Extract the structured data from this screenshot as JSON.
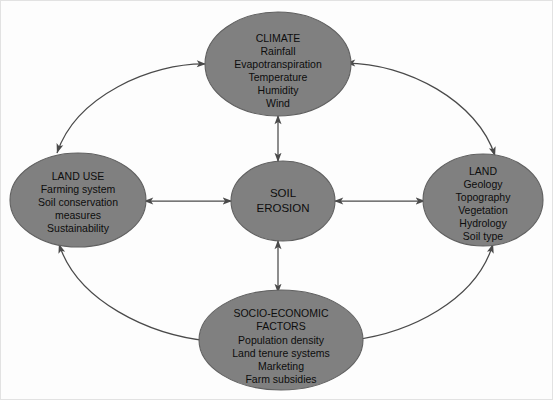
{
  "diagram": {
    "colors": {
      "node_fill": "#808080",
      "node_stroke": "#606060",
      "connector": "#4a4a4a",
      "text": "#0d0d0d",
      "background": "#fdfdfd",
      "border": "#e2e2e2"
    },
    "nodes": [
      {
        "id": "climate",
        "title": "CLIMATE",
        "items": [
          "Rainfall",
          "Evapotranspiration",
          "Temperature",
          "Humidity",
          "Wind"
        ],
        "lines": [
          "CLIMATE",
          "Rainfall",
          "Evapotranspiration",
          "Temperature",
          "Humidity",
          "Wind"
        ]
      },
      {
        "id": "land-use",
        "title": "LAND USE",
        "items": [
          "Farming system",
          "Soil conservation",
          "measures",
          "Sustainability"
        ],
        "lines": [
          "LAND USE",
          "Farming system",
          "Soil conservation",
          "measures",
          "Sustainability"
        ]
      },
      {
        "id": "soil-erosion",
        "title": "SOIL EROSION",
        "items": [],
        "lines": [
          "SOIL",
          "EROSION"
        ]
      },
      {
        "id": "land",
        "title": "LAND",
        "items": [
          "Geology",
          "Topography",
          "Vegetation",
          "Hydrology",
          "Soil type"
        ],
        "lines": [
          "LAND",
          "Geology",
          "Topography",
          "Vegetation",
          "Hydrology",
          "Soil type"
        ]
      },
      {
        "id": "socio-economic-factors",
        "title": "SOCIO-ECONOMIC FACTORS",
        "items": [
          "Population density",
          "Land tenure systems",
          "Marketing",
          "Farm subsidies"
        ],
        "lines": [
          "SOCIO-ECONOMIC",
          "FACTORS",
          "Population density",
          "Land tenure systems",
          "Marketing",
          "Farm subsidies"
        ]
      }
    ],
    "connectors": [
      {
        "id": "climate-soil-erosion",
        "from": "CLIMATE",
        "to": "SOIL EROSION",
        "kind": "straight",
        "bidirectional": true
      },
      {
        "id": "socio-economic-soil-erosion",
        "from": "SOCIO-ECONOMIC FACTORS",
        "to": "SOIL EROSION",
        "kind": "straight",
        "bidirectional": true
      },
      {
        "id": "land-use-soil-erosion",
        "from": "LAND USE",
        "to": "SOIL EROSION",
        "kind": "straight",
        "bidirectional": true
      },
      {
        "id": "land-soil-erosion",
        "from": "SOIL EROSION",
        "to": "LAND",
        "kind": "straight",
        "bidirectional": true
      },
      {
        "id": "climate-land-use",
        "from": "CLIMATE",
        "to": "LAND USE",
        "kind": "curve",
        "bidirectional": true
      },
      {
        "id": "climate-land",
        "from": "CLIMATE",
        "to": "LAND",
        "kind": "curve",
        "bidirectional": true
      },
      {
        "id": "land-use-socio-economic",
        "from": "LAND USE",
        "to": "SOCIO-ECONOMIC FACTORS",
        "kind": "curve",
        "bidirectional": true
      },
      {
        "id": "land-socio-economic",
        "from": "LAND",
        "to": "SOCIO-ECONOMIC FACTORS",
        "kind": "curve",
        "bidirectional": true
      }
    ]
  }
}
